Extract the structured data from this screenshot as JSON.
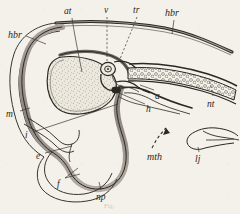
{
  "figure": {
    "background_color": "#f3f1ea",
    "ink_color": "#2b2722",
    "band_fill_color": "#9a948c",
    "stipple_fill_color": "#ece8dd",
    "caption": "Fig."
  },
  "labels": [
    {
      "key": "hbr_left",
      "text": "hbr",
      "x": 8,
      "y": 30
    },
    {
      "key": "at",
      "text": "at",
      "x": 64,
      "y": 7
    },
    {
      "key": "v",
      "text": "v",
      "x": 104,
      "y": 6
    },
    {
      "key": "tr",
      "text": "tr",
      "x": 133,
      "y": 6
    },
    {
      "key": "hbr_right",
      "text": "hbr",
      "x": 165,
      "y": 8
    },
    {
      "key": "a",
      "text": "a",
      "x": 155,
      "y": 92
    },
    {
      "key": "nt",
      "text": "nt",
      "x": 207,
      "y": 100
    },
    {
      "key": "h",
      "text": "h",
      "x": 146,
      "y": 105
    },
    {
      "key": "m",
      "text": "m",
      "x": 6,
      "y": 110
    },
    {
      "key": "i",
      "text": "i",
      "x": 25,
      "y": 131
    },
    {
      "key": "e",
      "text": "e",
      "x": 36,
      "y": 152
    },
    {
      "key": "f",
      "text": "f",
      "x": 57,
      "y": 180
    },
    {
      "key": "np",
      "text": "np",
      "x": 96,
      "y": 193
    },
    {
      "key": "mth",
      "text": "mth",
      "x": 147,
      "y": 152
    },
    {
      "key": "lj",
      "text": "lj",
      "x": 195,
      "y": 155
    }
  ],
  "structures": [
    {
      "key": "hind-brain-dorsal-wall",
      "label_ref": "hbr"
    },
    {
      "key": "atrium-cavity",
      "label_ref": "at"
    },
    {
      "key": "ventricle",
      "label_ref": "v"
    },
    {
      "key": "truncus",
      "label_ref": "tr"
    },
    {
      "key": "notochord",
      "label_ref": "nt"
    },
    {
      "key": "aorta",
      "label_ref": "a"
    },
    {
      "key": "heart",
      "label_ref": "h"
    },
    {
      "key": "mid-brain",
      "label_ref": "m"
    },
    {
      "key": "infundibulum",
      "label_ref": "i"
    },
    {
      "key": "eye-vesicle",
      "label_ref": "e"
    },
    {
      "key": "fore-brain",
      "label_ref": "f"
    },
    {
      "key": "neuropore",
      "label_ref": "np"
    },
    {
      "key": "mouth-direction-arrow",
      "label_ref": "mth"
    },
    {
      "key": "lower-jaw-inset",
      "label_ref": "lj"
    }
  ]
}
